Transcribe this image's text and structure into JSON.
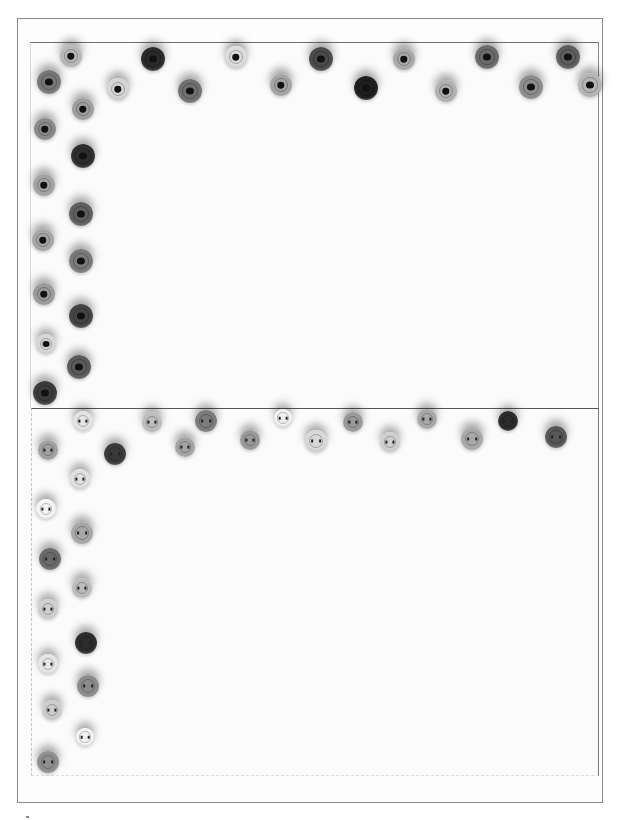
{
  "image": {
    "description": "Grayscale photo of two craft cards bordered with rows of quilled coils (top) and sewing buttons (bottom) arranged in an L-shaped border",
    "colors": {
      "background": "#ffffff",
      "frame": "#8a8a8a",
      "card_edge": "#6e6e6e"
    }
  },
  "top_card": {
    "label": "quilled-coil border card",
    "coils": [
      {
        "x": 71,
        "y": 56,
        "d": 22,
        "c": "#b8b8b8"
      },
      {
        "x": 153,
        "y": 59,
        "d": 24,
        "c": "#2a2a2a"
      },
      {
        "x": 236,
        "y": 57,
        "d": 22,
        "c": "#dcdcdc"
      },
      {
        "x": 321,
        "y": 59,
        "d": 24,
        "c": "#4a4a4a"
      },
      {
        "x": 404,
        "y": 59,
        "d": 22,
        "c": "#a9a9a9"
      },
      {
        "x": 487,
        "y": 57,
        "d": 24,
        "c": "#6a6a6a"
      },
      {
        "x": 568,
        "y": 57,
        "d": 24,
        "c": "#5e5e5e"
      },
      {
        "x": 49,
        "y": 82,
        "d": 24,
        "c": "#777"
      },
      {
        "x": 118,
        "y": 89,
        "d": 22,
        "c": "#d4d4d4"
      },
      {
        "x": 190,
        "y": 91,
        "d": 24,
        "c": "#707070"
      },
      {
        "x": 281,
        "y": 85,
        "d": 22,
        "c": "#a4a4a4"
      },
      {
        "x": 366,
        "y": 88,
        "d": 24,
        "c": "#1e1e1e"
      },
      {
        "x": 446,
        "y": 91,
        "d": 22,
        "c": "#b0b0b0"
      },
      {
        "x": 531,
        "y": 87,
        "d": 24,
        "c": "#8c8c8c"
      },
      {
        "x": 590,
        "y": 85,
        "d": 24,
        "c": "#b5b5b5"
      },
      {
        "x": 83,
        "y": 109,
        "d": 22,
        "c": "#9e9e9e"
      },
      {
        "x": 45,
        "y": 129,
        "d": 22,
        "c": "#8a8a8a"
      },
      {
        "x": 83,
        "y": 156,
        "d": 24,
        "c": "#2e2e2e"
      },
      {
        "x": 44,
        "y": 185,
        "d": 22,
        "c": "#a3a3a3"
      },
      {
        "x": 81,
        "y": 214,
        "d": 24,
        "c": "#5f5f5f"
      },
      {
        "x": 43,
        "y": 240,
        "d": 22,
        "c": "#a6a6a6"
      },
      {
        "x": 81,
        "y": 261,
        "d": 24,
        "c": "#7a7a7a"
      },
      {
        "x": 44,
        "y": 294,
        "d": 22,
        "c": "#9a9a9a"
      },
      {
        "x": 81,
        "y": 316,
        "d": 24,
        "c": "#444"
      },
      {
        "x": 46,
        "y": 344,
        "d": 20,
        "c": "#d6d6d6"
      },
      {
        "x": 79,
        "y": 367,
        "d": 24,
        "c": "#5a5a5a"
      },
      {
        "x": 45,
        "y": 393,
        "d": 24,
        "c": "#3c3c3c"
      }
    ]
  },
  "bottom_card": {
    "label": "sewing-button border card",
    "buttons": [
      {
        "x": 83,
        "y": 421,
        "d": 20,
        "c": "#e4e4e4"
      },
      {
        "x": 152,
        "y": 422,
        "d": 20,
        "c": "#bdbdbd"
      },
      {
        "x": 206,
        "y": 421,
        "d": 22,
        "c": "#7c7c7c"
      },
      {
        "x": 283,
        "y": 418,
        "d": 18,
        "c": "#f2f2f2"
      },
      {
        "x": 353,
        "y": 422,
        "d": 20,
        "c": "#9a9a9a"
      },
      {
        "x": 427,
        "y": 419,
        "d": 20,
        "c": "#a8a8a8"
      },
      {
        "x": 508,
        "y": 421,
        "d": 20,
        "c": "#2c2c2c"
      },
      {
        "x": 48,
        "y": 450,
        "d": 20,
        "c": "#a0a0a0"
      },
      {
        "x": 115,
        "y": 454,
        "d": 22,
        "c": "#3a3a3a"
      },
      {
        "x": 185,
        "y": 447,
        "d": 20,
        "c": "#a4a4a4"
      },
      {
        "x": 250,
        "y": 440,
        "d": 20,
        "c": "#999"
      },
      {
        "x": 316,
        "y": 441,
        "d": 22,
        "c": "#d8d8d8"
      },
      {
        "x": 390,
        "y": 442,
        "d": 20,
        "c": "#cfcfcf"
      },
      {
        "x": 472,
        "y": 439,
        "d": 22,
        "c": "#a8a8a8"
      },
      {
        "x": 556,
        "y": 437,
        "d": 22,
        "c": "#575757"
      },
      {
        "x": 80,
        "y": 479,
        "d": 20,
        "c": "#e0e0e0"
      },
      {
        "x": 46,
        "y": 509,
        "d": 20,
        "c": "#f4f4f4"
      },
      {
        "x": 82,
        "y": 533,
        "d": 22,
        "c": "#a7a7a7"
      },
      {
        "x": 50,
        "y": 559,
        "d": 22,
        "c": "#6a6a6a"
      },
      {
        "x": 82,
        "y": 588,
        "d": 20,
        "c": "#bcbcbc"
      },
      {
        "x": 48,
        "y": 609,
        "d": 20,
        "c": "#cfcfcf"
      },
      {
        "x": 86,
        "y": 643,
        "d": 22,
        "c": "#2c2c2c"
      },
      {
        "x": 48,
        "y": 664,
        "d": 20,
        "c": "#e6e6e6"
      },
      {
        "x": 88,
        "y": 686,
        "d": 22,
        "c": "#8c8c8c"
      },
      {
        "x": 52,
        "y": 710,
        "d": 20,
        "c": "#cccccc"
      },
      {
        "x": 85,
        "y": 737,
        "d": 18,
        "c": "#f4f4f4"
      },
      {
        "x": 48,
        "y": 762,
        "d": 22,
        "c": "#8f8f8f"
      }
    ]
  }
}
